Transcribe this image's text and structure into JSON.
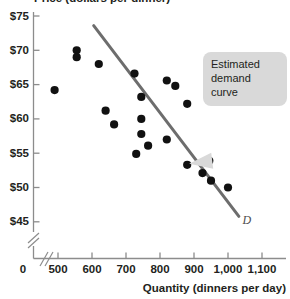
{
  "chart_data": {
    "type": "scatter",
    "title": "Price (dollars per dinner)",
    "xlabel": "Quantity (dinners per day)",
    "ylabel": "Price (dollars per dinner)",
    "xlim": [
      440,
      1140
    ],
    "ylim": [
      43.0,
      76.5
    ],
    "xticks": [
      "500",
      "600",
      "700",
      "800",
      "900",
      "1,000",
      "1,100"
    ],
    "xtick_values": [
      500,
      600,
      700,
      800,
      900,
      1000,
      1100
    ],
    "yticks": [
      "$75",
      "$70",
      "$65",
      "$60",
      "$55",
      "$50",
      "$45"
    ],
    "ytick_values": [
      75,
      70,
      65,
      60,
      55,
      50,
      45
    ],
    "origin_label": "0",
    "grid": false,
    "axis_break_x": true,
    "axis_break_y": true,
    "legend": "none",
    "series": [
      {
        "name": "Observed price and quantity",
        "marker": "filled-circle",
        "color": "#111111",
        "points": [
          [
            490,
            64.2
          ],
          [
            555,
            70.0
          ],
          [
            555,
            69.0
          ],
          [
            620,
            68.0
          ],
          [
            640,
            61.2
          ],
          [
            665,
            59.2
          ],
          [
            725,
            66.6
          ],
          [
            730,
            54.9
          ],
          [
            745,
            63.2
          ],
          [
            745,
            60.0
          ],
          [
            745,
            57.8
          ],
          [
            765,
            56.1
          ],
          [
            820,
            65.6
          ],
          [
            820,
            57.0
          ],
          [
            845,
            64.8
          ],
          [
            880,
            62.2
          ],
          [
            880,
            53.3
          ],
          [
            925,
            52.1
          ],
          [
            945,
            53.9
          ],
          [
            950,
            51.0
          ],
          [
            1000,
            50.0
          ]
        ]
      }
    ],
    "line": {
      "name": "Estimated demand curve",
      "label": "D",
      "color": "#6d6d6d",
      "start": [
        605,
        73.6
      ],
      "end": [
        1032,
        45.8
      ]
    },
    "annotation": {
      "text_lines": [
        "Estimated",
        "demand",
        "curve"
      ],
      "text": "Estimated demand curve",
      "box_color": "#d9d9d9",
      "points_to": [
        880,
        53.3
      ]
    }
  },
  "colors": {
    "axis": "#8c8c8c",
    "text": "#231f20",
    "marker": "#111111",
    "curve": "#6d6d6d",
    "callout_bg": "#d9d9d9"
  }
}
